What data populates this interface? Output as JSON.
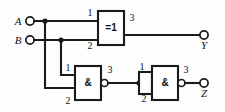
{
  "diagram": {
    "background_color": "#fdfdfd",
    "line_color": "#1a1a1a",
    "inputs": [
      {
        "id": "A",
        "label": "A",
        "terminal": "input-terminal-a"
      },
      {
        "id": "B",
        "label": "B",
        "terminal": "input-terminal-b"
      }
    ],
    "outputs": [
      {
        "id": "Y",
        "label": "Y",
        "terminal": "output-terminal-y"
      },
      {
        "id": "Z",
        "label": "Z",
        "terminal": "output-terminal-z"
      }
    ],
    "gates": [
      {
        "id": "G1",
        "symbol": "=1",
        "type": "xor",
        "inverted_output": false,
        "pins": {
          "in1": "1",
          "in2": "2",
          "out": "3"
        }
      },
      {
        "id": "G2",
        "symbol": "&",
        "type": "nand",
        "inverted_output": true,
        "pins": {
          "in1": "1",
          "in2": "2",
          "out": "3"
        }
      },
      {
        "id": "G3",
        "symbol": "&",
        "type": "nand",
        "inverted_output": true,
        "pins": {
          "in1": "1",
          "in2": "2",
          "out": "3"
        }
      }
    ],
    "pin_numbers": {
      "g1_in1": "1",
      "g1_in2": "2",
      "g1_out": "3",
      "g2_in1": "1",
      "g2_in2": "2",
      "g2_out": "3",
      "g3_in1": "1",
      "g3_in2": "2",
      "g3_out": "3"
    }
  }
}
